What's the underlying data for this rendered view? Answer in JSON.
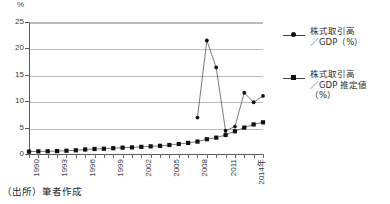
{
  "chart_data": {
    "type": "line",
    "title": "",
    "subtitle": "",
    "xlabel": "年",
    "ylabel": "%",
    "unit_label": "%",
    "ylim": [
      0,
      25
    ],
    "yticks": [
      0,
      5,
      10,
      15,
      20,
      25
    ],
    "xlim": [
      1990,
      2015
    ],
    "xticks": [
      1990,
      1993,
      1996,
      1999,
      2002,
      2005,
      2008,
      2011,
      2014
    ],
    "xtick_labels": [
      "1990",
      "1993",
      "1996",
      "1999",
      "2002",
      "2005",
      "2008",
      "2011",
      "2014年"
    ],
    "grid": "horizontal",
    "legend_position": "right",
    "x": [
      1990,
      1991,
      1992,
      1993,
      1994,
      1995,
      1996,
      1997,
      1998,
      1999,
      2000,
      2001,
      2002,
      2003,
      2004,
      2005,
      2006,
      2007,
      2008,
      2009,
      2010,
      2011,
      2012,
      2013,
      2014,
      2015
    ],
    "series": [
      {
        "name": "株式取引高／GDP（%）",
        "marker": "circle",
        "values": [
          null,
          null,
          null,
          null,
          null,
          null,
          null,
          null,
          null,
          null,
          null,
          null,
          null,
          null,
          null,
          null,
          null,
          null,
          6.9,
          21.5,
          16.4,
          4.4,
          5.2,
          11.6,
          9.8,
          11.0
        ]
      },
      {
        "name": "株式取引高／GDP 推定値（%）",
        "marker": "square",
        "values": [
          0.45,
          0.5,
          0.52,
          0.55,
          0.62,
          0.7,
          0.85,
          0.95,
          1.0,
          1.1,
          1.2,
          1.25,
          1.35,
          1.45,
          1.55,
          1.7,
          1.9,
          2.1,
          2.35,
          2.8,
          3.1,
          3.6,
          4.3,
          5.0,
          5.6,
          6.0
        ]
      }
    ],
    "legend": [
      {
        "line1": "株式取引高",
        "line2": "／GDP（%）",
        "marker": "circle"
      },
      {
        "line1": "株式取引高",
        "line2": "／GDP 推定値（%）",
        "marker": "square"
      }
    ],
    "colors": {
      "line": "#404040",
      "marker": "#111111",
      "grid": "#bcbcbc",
      "axis": "#5a5a5a",
      "text": "#2b2b2b"
    }
  },
  "footer": {
    "source_note": "（出所）筆者作成"
  }
}
